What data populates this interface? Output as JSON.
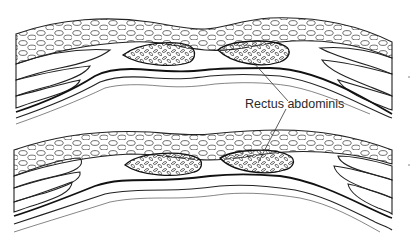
{
  "figure": {
    "type": "anatomical cross-section illustration",
    "panels": [
      {
        "id": "top",
        "description": "Abdominal wall cross-section, rectus muscles separated"
      },
      {
        "id": "bottom",
        "description": "Abdominal wall cross-section, rectus muscles approximated"
      }
    ],
    "label": {
      "text": "Rectus abdominis",
      "x": 245,
      "y": 106
    },
    "colors": {
      "line": "#222222",
      "background": "#ffffff"
    }
  }
}
